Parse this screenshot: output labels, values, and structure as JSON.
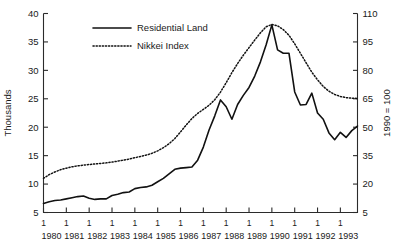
{
  "chart_data": {
    "type": "line",
    "title": "",
    "xlabel": "",
    "ylabel": "Thousands",
    "y2label": "1990 = 100",
    "grid": false,
    "legend_position": "top-center",
    "xlim": [
      1980.0,
      1993.75
    ],
    "ylim": [
      5,
      40
    ],
    "y2lim": [
      5,
      110
    ],
    "yticks": [
      5,
      10,
      15,
      20,
      25,
      30,
      35,
      40
    ],
    "y2ticks": [
      5,
      20,
      35,
      50,
      65,
      80,
      95,
      110
    ],
    "xticks": [
      1980,
      1981,
      1982,
      1983,
      1984,
      1985,
      1986,
      1987,
      1988,
      1989,
      1990,
      1991,
      1992,
      1993
    ],
    "xtick_quarter_labels": [
      "1",
      "1",
      "1",
      "1",
      "1",
      "1",
      "1",
      "1",
      "1",
      "1",
      "1",
      "1",
      "1",
      "1"
    ],
    "xtick_year_labels": [
      "1980",
      "1981",
      "1982",
      "1983",
      "1984",
      "1985",
      "1986",
      "1987",
      "1988",
      "1989",
      "1990",
      "1991",
      "1992",
      "1993"
    ],
    "x": [
      1980.0,
      1980.25,
      1980.5,
      1980.75,
      1981.0,
      1981.25,
      1981.5,
      1981.75,
      1982.0,
      1982.25,
      1982.5,
      1982.75,
      1983.0,
      1983.25,
      1983.5,
      1983.75,
      1984.0,
      1984.25,
      1984.5,
      1984.75,
      1985.0,
      1985.25,
      1985.5,
      1985.75,
      1986.0,
      1986.25,
      1986.5,
      1986.75,
      1987.0,
      1987.25,
      1987.5,
      1987.75,
      1988.0,
      1988.25,
      1988.5,
      1988.75,
      1989.0,
      1989.25,
      1989.5,
      1989.75,
      1990.0,
      1990.25,
      1990.5,
      1990.75,
      1991.0,
      1991.25,
      1991.5,
      1991.75,
      1992.0,
      1992.25,
      1992.5,
      1992.75,
      1993.0,
      1993.25,
      1993.5,
      1993.75
    ],
    "series": [
      {
        "name": "Residential Land",
        "style": "solid",
        "axis": "left",
        "units": "Thousands",
        "values": [
          6.6,
          6.9,
          7.1,
          7.2,
          7.4,
          7.6,
          7.8,
          7.9,
          7.5,
          7.3,
          7.4,
          7.4,
          8.0,
          8.2,
          8.5,
          8.6,
          9.2,
          9.4,
          9.5,
          9.8,
          10.4,
          11.0,
          11.8,
          12.6,
          12.8,
          12.9,
          13.0,
          14.2,
          16.5,
          19.5,
          22.0,
          24.8,
          23.6,
          21.4,
          24.0,
          25.6,
          27.0,
          29.0,
          31.5,
          34.5,
          38.0,
          33.6,
          33.0,
          33.0,
          26.2,
          23.9,
          24.0,
          26.0,
          22.5,
          21.4,
          19.0,
          17.8,
          19.1,
          18.2,
          19.4,
          20.2
        ]
      },
      {
        "name": "Nikkei Index",
        "style": "dotted",
        "axis": "right",
        "units": "1990 = 100",
        "values": [
          23.0,
          25.0,
          26.4,
          27.6,
          28.4,
          29.1,
          29.6,
          30.0,
          30.3,
          30.6,
          30.9,
          31.2,
          31.6,
          32.1,
          32.6,
          33.2,
          33.9,
          34.6,
          35.3,
          36.2,
          37.5,
          39.2,
          41.3,
          44.0,
          47.5,
          51.2,
          54.6,
          57.3,
          59.4,
          61.6,
          64.5,
          68.5,
          73.5,
          78.8,
          83.6,
          88.0,
          92.0,
          96.0,
          99.8,
          103.0,
          104.2,
          103.5,
          101.5,
          98.5,
          94.0,
          89.0,
          84.0,
          79.0,
          75.0,
          71.5,
          69.0,
          67.3,
          66.2,
          65.6,
          65.3,
          65.2
        ]
      }
    ],
    "legend": [
      {
        "label": "Residential Land",
        "style": "solid"
      },
      {
        "label": "Nikkei Index",
        "style": "dotted"
      }
    ]
  }
}
